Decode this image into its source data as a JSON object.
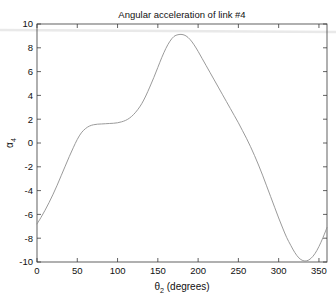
{
  "chart_data": {
    "type": "line",
    "title": "Angular acceleration of link #4",
    "xlabel": "θ₂ (degrees)",
    "ylabel": "α₄",
    "xlabel_base": "θ",
    "xlabel_sub": "2",
    "xlabel_tail": " (degrees)",
    "ylabel_base": "α",
    "ylabel_sub": "4",
    "xlim": [
      0,
      360
    ],
    "ylim": [
      -10,
      10
    ],
    "xticks": [
      0,
      50,
      100,
      150,
      200,
      250,
      300,
      350
    ],
    "yticks": [
      -10,
      -8,
      -6,
      -4,
      -2,
      0,
      2,
      4,
      6,
      8,
      10
    ],
    "xtick_labels": [
      "0",
      "50",
      "100",
      "150",
      "200",
      "250",
      "300",
      "350"
    ],
    "ytick_labels": [
      "-10",
      "-8",
      "-6",
      "-4",
      "-2",
      "0",
      "2",
      "4",
      "6",
      "8",
      "10"
    ],
    "grid": false,
    "legend": null,
    "box": true,
    "tick_direction": "in",
    "line_color": "#8e8e8e",
    "background_color": "#ffffff",
    "axis_color": "#3b3b3b",
    "series": [
      {
        "name": "alpha_4",
        "x": [
          0,
          5,
          10,
          15,
          20,
          25,
          30,
          35,
          40,
          45,
          50,
          55,
          60,
          65,
          70,
          75,
          80,
          85,
          90,
          95,
          100,
          105,
          110,
          115,
          120,
          125,
          130,
          135,
          140,
          145,
          150,
          155,
          160,
          165,
          170,
          175,
          180,
          185,
          190,
          195,
          200,
          205,
          210,
          215,
          220,
          225,
          230,
          235,
          240,
          245,
          250,
          255,
          260,
          265,
          270,
          275,
          280,
          285,
          290,
          295,
          300,
          305,
          310,
          315,
          320,
          325,
          330,
          335,
          340,
          345,
          350,
          355,
          360
        ],
        "y": [
          -6.8,
          -6.25,
          -5.65,
          -5.0,
          -4.3,
          -3.55,
          -2.75,
          -1.95,
          -1.15,
          -0.4,
          0.3,
          0.85,
          1.2,
          1.42,
          1.53,
          1.58,
          1.6,
          1.62,
          1.64,
          1.66,
          1.7,
          1.78,
          1.9,
          2.1,
          2.4,
          2.8,
          3.3,
          3.95,
          4.7,
          5.5,
          6.35,
          7.2,
          7.95,
          8.55,
          8.95,
          9.1,
          9.12,
          9.0,
          8.7,
          8.25,
          7.7,
          7.1,
          6.5,
          5.9,
          5.3,
          4.7,
          4.1,
          3.5,
          2.9,
          2.3,
          1.7,
          1.05,
          0.4,
          -0.3,
          -1.05,
          -1.85,
          -2.7,
          -3.6,
          -4.5,
          -5.4,
          -6.3,
          -7.15,
          -7.95,
          -8.6,
          -9.2,
          -9.65,
          -9.88,
          -9.9,
          -9.7,
          -9.3,
          -8.7,
          -7.95,
          -7.1
        ]
      }
    ],
    "annotations": {
      "peak": {
        "x": 181,
        "y": 9.12
      },
      "trough": {
        "x": 333,
        "y": -9.9
      },
      "plateau_value": 1.6,
      "start_value": -6.8,
      "end_value": -7.1
    }
  },
  "figure": {
    "plot_left": 37,
    "plot_right": 327,
    "plot_top": 24,
    "plot_bottom": 262
  }
}
